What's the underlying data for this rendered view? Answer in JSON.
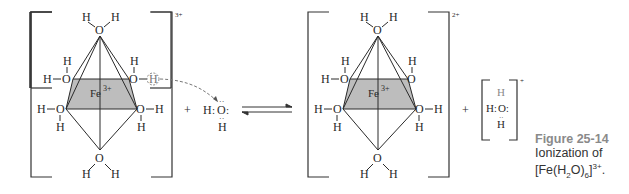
{
  "figure": {
    "number_label": "Figure 25-14",
    "caption_line1": "Ionization of",
    "caption_formula_prefix": "[Fe(H",
    "caption_sub_2": "2",
    "caption_formula_mid": "O)",
    "caption_sub_6": "6",
    "caption_formula_close": "]",
    "caption_charge": "3+",
    "caption_end": "."
  },
  "reactant_complex": {
    "metal_label": "Fe",
    "metal_charge": "3+",
    "complex_charge": "3+",
    "ligand": "H2O",
    "atom_O": "O",
    "atom_H": "H",
    "transferred_proton": "H"
  },
  "water": {
    "formula_left": "H",
    "center": "O",
    "bottom": "H"
  },
  "product_complex": {
    "metal_label": "Fe",
    "metal_charge": "3+",
    "complex_charge": "2+"
  },
  "hydronium": {
    "top": "H",
    "left": "H",
    "center": "O",
    "bottom": "H",
    "charge": "+"
  },
  "operators": {
    "plus": "+",
    "equilibrium": "⇌"
  },
  "colors": {
    "ink": "#2a2a2a",
    "plane_fill": "#bdbdbd",
    "caption_title": "#8a8a8a",
    "proton_circle": "#888888"
  }
}
